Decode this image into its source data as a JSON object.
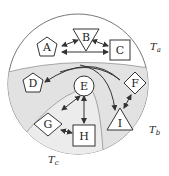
{
  "nodes": {
    "A": "A",
    "B": "B",
    "C": "C",
    "D": "D",
    "E": "E",
    "F": "F",
    "G": "G",
    "H": "H",
    "I": "I"
  },
  "regions": {
    "ta": {
      "label": "T",
      "sub": "a"
    },
    "tb": {
      "label": "T",
      "sub": "b"
    },
    "tc": {
      "label": "T",
      "sub": "c"
    }
  },
  "colors": {
    "ta_fill": "#ffffff",
    "tb_fill": "#e2e2e2",
    "tc_fill": "#ececec",
    "stroke": "#333333"
  }
}
